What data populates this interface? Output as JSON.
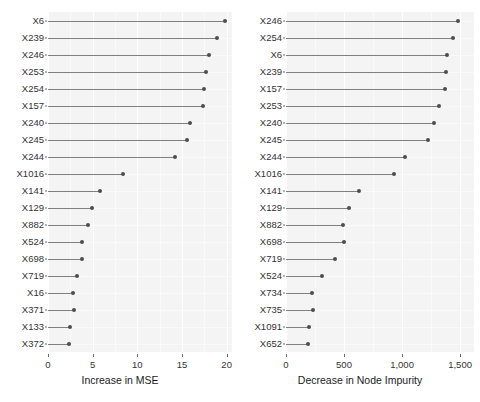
{
  "chart_data": [
    {
      "type": "bar",
      "variant": "lollipop-dotchart",
      "panel": "left",
      "title": "",
      "xlabel": "Increase in MSE",
      "ylabel": "",
      "xlim": [
        0,
        20.6
      ],
      "xticks": [
        0,
        5,
        10,
        15,
        20
      ],
      "xticklabels": [
        "0",
        "5",
        "10",
        "15",
        "20"
      ],
      "grid": true,
      "legend": null,
      "categories": [
        "X6",
        "X239",
        "X246",
        "X253",
        "X254",
        "X157",
        "X240",
        "X245",
        "X244",
        "X1016",
        "X141",
        "X129",
        "X882",
        "X524",
        "X698",
        "X719",
        "X16",
        "X371",
        "X133",
        "X372"
      ],
      "values": [
        19.8,
        18.9,
        18.0,
        17.7,
        17.5,
        17.3,
        15.9,
        15.6,
        14.2,
        8.4,
        5.8,
        4.9,
        4.5,
        3.8,
        3.8,
        3.2,
        2.8,
        2.9,
        2.5,
        2.4
      ]
    },
    {
      "type": "bar",
      "variant": "lollipop-dotchart",
      "panel": "right",
      "title": "",
      "xlabel": "Decrease in Node Impurity",
      "ylabel": "",
      "xlim": [
        0,
        1620
      ],
      "xticks": [
        0,
        500,
        1000,
        1500
      ],
      "xticklabels": [
        "0",
        "500",
        "1,000",
        "1,500"
      ],
      "grid": true,
      "legend": null,
      "categories": [
        "X246",
        "X254",
        "X6",
        "X239",
        "X157",
        "X253",
        "X240",
        "X245",
        "X244",
        "X1016",
        "X141",
        "X129",
        "X882",
        "X698",
        "X719",
        "X524",
        "X734",
        "X735",
        "X1091",
        "X652"
      ],
      "values": [
        1485,
        1438,
        1390,
        1382,
        1371,
        1320,
        1275,
        1222,
        1026,
        928,
        625,
        542,
        494,
        500,
        418,
        314,
        227,
        233,
        201,
        186
      ]
    }
  ],
  "colors": {
    "panel_background": "#f4f4f4",
    "gridline": "#ffffff",
    "segment": "#808080",
    "point": "#4d4d4d",
    "text": "#333333"
  }
}
